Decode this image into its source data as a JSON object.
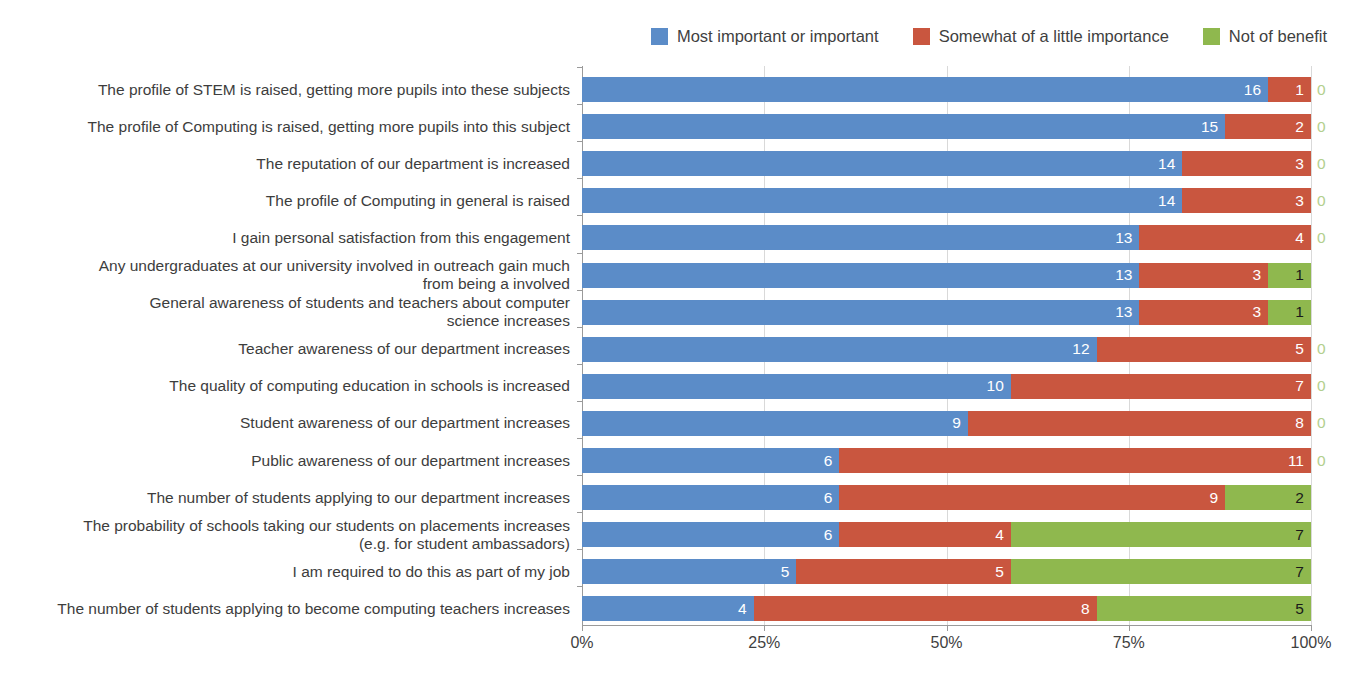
{
  "legend": {
    "position": "top-right",
    "items": [
      {
        "label": "Most important or important",
        "color": "#5b8cc8",
        "swatch_name": "legend-swatch-most-important"
      },
      {
        "label": "Somewhat of a little importance",
        "color": "#c9563f",
        "swatch_name": "legend-swatch-somewhat"
      },
      {
        "label": "Not of benefit",
        "color": "#8fb84e",
        "swatch_name": "legend-swatch-not-of-benefit"
      }
    ]
  },
  "axis": {
    "x_ticks": [
      "0%",
      "25%",
      "50%",
      "75%",
      "100%"
    ],
    "x_values": [
      0,
      25,
      50,
      75,
      100
    ]
  },
  "chart_data": {
    "type": "bar",
    "orientation": "horizontal",
    "stacked": true,
    "normalized": true,
    "title": "",
    "xlabel": "",
    "ylabel": "",
    "xlim": [
      0,
      100
    ],
    "grid": true,
    "legend_position": "top-right",
    "total_respondents": 17,
    "series": [
      {
        "name": "Most important or important",
        "color": "#5b8cc8",
        "values": [
          16,
          15,
          14,
          14,
          13,
          13,
          13,
          12,
          10,
          9,
          6,
          6,
          6,
          5,
          4
        ]
      },
      {
        "name": "Somewhat of a little importance",
        "color": "#c9563f",
        "values": [
          1,
          2,
          3,
          3,
          4,
          3,
          3,
          5,
          7,
          8,
          11,
          9,
          4,
          5,
          8
        ]
      },
      {
        "name": "Not of benefit",
        "color": "#8fb84e",
        "values": [
          0,
          0,
          0,
          0,
          0,
          1,
          1,
          0,
          0,
          0,
          0,
          2,
          7,
          7,
          5
        ]
      }
    ],
    "categories": [
      "The profile of STEM is raised, getting more pupils into these subjects",
      "The profile of Computing is raised, getting more pupils into this subject",
      "The reputation of our department is increased",
      "The profile of Computing in general is raised",
      "I gain personal satisfaction from this engagement",
      "Any undergraduates at our university involved in outreach gain much\nfrom being a involved",
      "General awareness of students and teachers about computer\nscience increases",
      "Teacher awareness of our department increases",
      "The quality of computing education in schools is increased",
      "Student awareness of our department increases",
      "Public  awareness of our department increases",
      "The number of students applying to our department increases",
      "The probability of schools taking our students on placements increases\n(e.g. for student ambassadors)",
      "I am required to do this as part of my job",
      "The number of students applying to become computing teachers increases"
    ]
  }
}
